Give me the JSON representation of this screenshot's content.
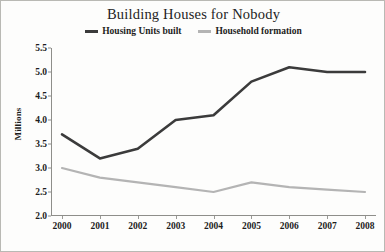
{
  "chart_data": {
    "type": "line",
    "title": "Building Houses for Nobody",
    "xlabel": "",
    "ylabel": "Millions",
    "categories": [
      "2000",
      "2001",
      "2002",
      "2003",
      "2004",
      "2005",
      "2006",
      "2007",
      "2008"
    ],
    "series": [
      {
        "name": "Housing Units built",
        "color": "#3b3b3b",
        "values": [
          3.7,
          3.2,
          3.4,
          4.0,
          4.1,
          4.8,
          5.1,
          5.0,
          5.0
        ]
      },
      {
        "name": "Household formation",
        "color": "#b4b4b4",
        "values": [
          3.0,
          2.8,
          2.7,
          2.6,
          2.5,
          2.7,
          2.6,
          2.55,
          2.5
        ]
      }
    ],
    "ylim": [
      2.0,
      5.5
    ],
    "y_ticks": [
      "2.0",
      "2.5",
      "3.0",
      "3.5",
      "4.0",
      "4.5",
      "5.0",
      "5.5"
    ],
    "grid": false,
    "legend_position": "top"
  },
  "colors": {
    "background": "#fdfdfc",
    "border": "#b9b9b4",
    "axis": "#8e8e8a",
    "text": "#1d1d1d",
    "series_dark": "#3b3b3b",
    "series_light": "#b4b4b4"
  }
}
